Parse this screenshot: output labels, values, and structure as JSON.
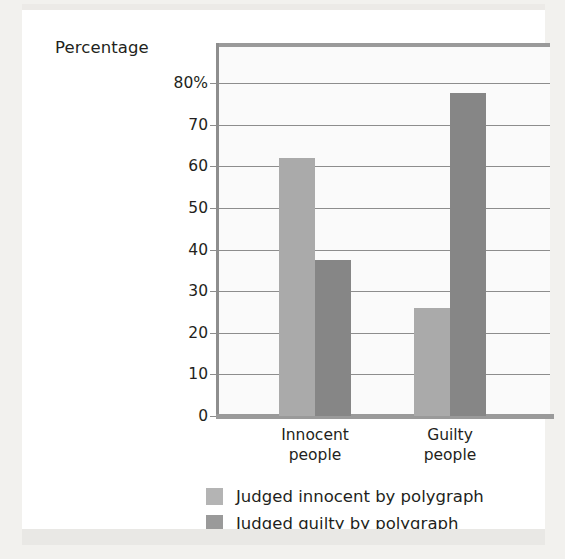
{
  "chart_data": {
    "type": "bar",
    "title": "",
    "ylabel": "Percentage",
    "xlabel": "",
    "categories": [
      "Innocent\npeople",
      "Guilty\npeople"
    ],
    "category_lines": [
      [
        "Innocent",
        "people"
      ],
      [
        "Guilty",
        "people"
      ]
    ],
    "series": [
      {
        "name": "Judged innocent by polygraph",
        "color": "#aaaaaa",
        "values": [
          62,
          26
        ]
      },
      {
        "name": "Judged guilty by polygraph",
        "color": "#868686",
        "values": [
          37.5,
          77.5
        ]
      }
    ],
    "ylim": [
      0,
      85
    ],
    "yticks": [
      0,
      10,
      20,
      30,
      40,
      50,
      60,
      70,
      80
    ],
    "ytick_labels": [
      "0",
      "10",
      "20",
      "30",
      "40",
      "50",
      "60",
      "70",
      "80%"
    ],
    "grid": true,
    "legend_position": "bottom"
  },
  "legend": {
    "entries": [
      {
        "label": "Judged innocent by polygraph",
        "swatch": "light-gray-swatch"
      },
      {
        "label": "Judged guilty by polygraph",
        "swatch": "dark-gray-swatch"
      }
    ]
  },
  "colors": {
    "page_background": "#f2f1ee",
    "card_background": "#ffffff",
    "plot_background": "#fafafa",
    "series_light": "#aaaaaa",
    "series_dark": "#868686",
    "axis": "#9a9a9a",
    "gridline": "#8d8d8d",
    "text": "#231f20"
  }
}
